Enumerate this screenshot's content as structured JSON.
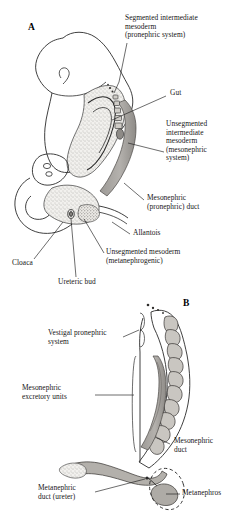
{
  "figure": {
    "background_color": "#ffffff",
    "ink_color": "#1a1a1a",
    "stipple_fill": "#e8e6e2",
    "gray_fill": "#a9a6a2",
    "dark_gray_fill": "#8c8985"
  },
  "panels": [
    {
      "id": "A",
      "letter": "A",
      "letter_pos": {
        "x": 28,
        "y": 28
      },
      "description": "Sagittal view of embryo showing segmented and unsegmented intermediate mesoderm along the gut",
      "labels": [
        {
          "name": "segmented-intermediate-mesoderm",
          "text": "Segmented intermediate\nmesoderm\n(pronephric system)",
          "x": 125,
          "y": 15,
          "align": "left"
        },
        {
          "name": "gut",
          "text": "Gut",
          "x": 168,
          "y": 92,
          "align": "left"
        },
        {
          "name": "unsegmented-intermediate-mesoderm",
          "text": "Unsegmented\nintermediate\nmesoderm\n(mesonephric\nsystem)",
          "x": 166,
          "y": 122,
          "align": "left"
        },
        {
          "name": "mesonephric-pronephric-duct",
          "text": "Mesonephric\n(pronephric) duct",
          "x": 146,
          "y": 196,
          "align": "left"
        },
        {
          "name": "allantois",
          "text": "Allantois",
          "x": 132,
          "y": 231,
          "align": "left"
        },
        {
          "name": "unsegmented-mesoderm-metanephrogenic",
          "text": "Unsegmented mesoderm\n(metanephrogenic)",
          "x": 106,
          "y": 250,
          "align": "left"
        },
        {
          "name": "cloaca",
          "text": "Cloaca",
          "x": 12,
          "y": 261,
          "align": "left"
        },
        {
          "name": "ureteric-bud",
          "text": "Ureteric bud",
          "x": 58,
          "y": 280,
          "align": "left"
        }
      ]
    },
    {
      "id": "B",
      "letter": "B",
      "letter_pos": {
        "x": 183,
        "y": 303
      },
      "description": "Enlarged view of the urogenital ridge with vestigal pronephric system, mesonephric excretory units, mesonephric duct, metanephric duct and metanephros",
      "labels": [
        {
          "name": "vestigal-pronephric-system",
          "text": "Vestigal pronephric\nsystem",
          "x": 48,
          "y": 331,
          "align": "left"
        },
        {
          "name": "mesonephric-excretory-units",
          "text": "Mesonephric\nexcretory units",
          "x": 22,
          "y": 386,
          "align": "left"
        },
        {
          "name": "mesonephric-duct",
          "text": "Mesonephric\nduct",
          "x": 172,
          "y": 440,
          "align": "left"
        },
        {
          "name": "metanephric-duct-ureter",
          "text": "Metanephric\nduct (ureter)",
          "x": 38,
          "y": 486,
          "align": "left"
        },
        {
          "name": "metanephros",
          "text": "Metanephros",
          "x": 168,
          "y": 491,
          "align": "left"
        }
      ]
    }
  ]
}
